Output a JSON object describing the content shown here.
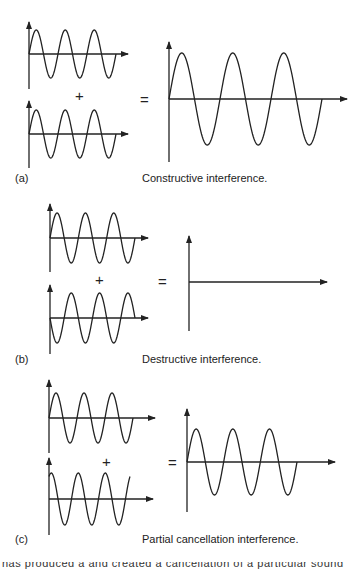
{
  "figure": {
    "stroke_color": "#222222",
    "background": "#ffffff",
    "panels": [
      {
        "id": "a",
        "label": "(a)",
        "caption": "Constructive interference.",
        "plus": "+",
        "equals": "=",
        "inputs": [
          {
            "name": "wave-1",
            "axis_x": 29,
            "axis_y": 54,
            "y_top": 22,
            "y_bottom": 89,
            "arrow_x": 128,
            "wave_end_x": 116,
            "amplitude": 24,
            "cycles": 3,
            "phase": 0
          },
          {
            "name": "wave-2",
            "axis_x": 29,
            "axis_y": 134,
            "y_top": 101,
            "y_bottom": 168,
            "arrow_x": 128,
            "wave_end_x": 116,
            "amplitude": 24,
            "cycles": 3,
            "phase": 0
          }
        ],
        "result": {
          "name": "sum",
          "axis_x": 169,
          "axis_y": 99,
          "y_top": 42,
          "y_bottom": 162,
          "arrow_x": 347,
          "wave_end_x": 322,
          "amplitude": 46,
          "cycles": 3,
          "phase": 0
        }
      },
      {
        "id": "b",
        "label": "(b)",
        "caption": "Destructive interference.",
        "plus": "+",
        "equals": "=",
        "inputs": [
          {
            "name": "wave-1",
            "axis_x": 50,
            "axis_y": 238,
            "y_top": 204,
            "y_bottom": 272,
            "arrow_x": 148,
            "wave_end_x": 135,
            "amplitude": 25,
            "cycles": 3,
            "phase": 0
          },
          {
            "name": "wave-2",
            "axis_x": 50,
            "axis_y": 318,
            "y_top": 285,
            "y_bottom": 354,
            "arrow_x": 148,
            "wave_end_x": 135,
            "amplitude": 25,
            "cycles": 3,
            "phase": 180
          }
        ],
        "result": {
          "name": "sum",
          "axis_x": 189,
          "axis_y": 282,
          "y_top": 236,
          "y_bottom": 331,
          "arrow_x": 327,
          "wave_end_x": 189,
          "amplitude": 0,
          "cycles": 0,
          "phase": 0
        }
      },
      {
        "id": "c",
        "label": "(c)",
        "caption": "Partial cancellation interference.",
        "plus": "+",
        "equals": "=",
        "inputs": [
          {
            "name": "wave-1",
            "axis_x": 49,
            "axis_y": 418,
            "y_top": 380,
            "y_bottom": 453,
            "arrow_x": 155,
            "wave_end_x": 133,
            "amplitude": 25,
            "cycles": 3,
            "phase": 0
          },
          {
            "name": "wave-2",
            "axis_x": 49,
            "axis_y": 499,
            "y_top": 458,
            "y_bottom": 535,
            "arrow_x": 153,
            "wave_end_x": 130,
            "amplitude": 26,
            "cycles": 3,
            "phase": 60
          }
        ],
        "result": {
          "name": "sum",
          "axis_x": 187,
          "axis_y": 462,
          "y_top": 409,
          "y_bottom": 512,
          "arrow_x": 335,
          "wave_end_x": 297,
          "amplitude": 33,
          "cycles": 3,
          "phase": 0
        }
      }
    ],
    "operators": [
      {
        "panel": "a",
        "symbol": "plus",
        "x": 75,
        "y": 88
      },
      {
        "panel": "a",
        "symbol": "equals",
        "x": 140,
        "y": 92
      },
      {
        "panel": "b",
        "symbol": "plus",
        "x": 95,
        "y": 272
      },
      {
        "panel": "b",
        "symbol": "equals",
        "x": 158,
        "y": 274
      },
      {
        "panel": "c",
        "symbol": "plus",
        "x": 102,
        "y": 454
      },
      {
        "panel": "c",
        "symbol": "equals",
        "x": 168,
        "y": 455
      }
    ],
    "label_positions": [
      {
        "panel": "a",
        "label_x": 15,
        "label_y": 172,
        "caption_x": 142,
        "caption_y": 172
      },
      {
        "panel": "b",
        "label_x": 15,
        "label_y": 353,
        "caption_x": 142,
        "caption_y": 353
      },
      {
        "panel": "c",
        "label_x": 15,
        "label_y": 533,
        "caption_x": 142,
        "caption_y": 533
      }
    ],
    "footer_cropped_text": "has produced a and created a cancellation of a particular sound"
  }
}
